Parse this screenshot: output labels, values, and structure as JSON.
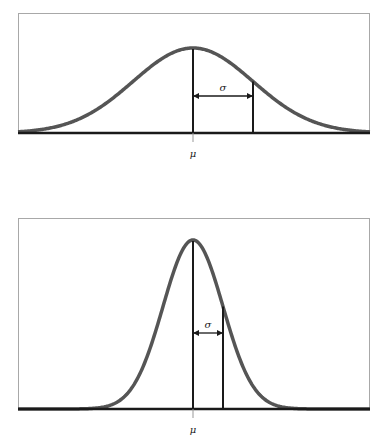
{
  "diagrams": [
    {
      "name": "wide-normal-distribution",
      "mean_label": "μ",
      "sd_label": "σ",
      "relative_sigma": 2.0
    },
    {
      "name": "narrow-normal-distribution",
      "mean_label": "μ",
      "sd_label": "σ",
      "relative_sigma": 1.0
    }
  ]
}
